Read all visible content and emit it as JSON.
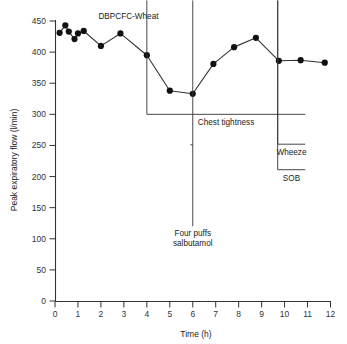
{
  "chart_data": {
    "type": "line",
    "title": "",
    "xlabel": "Time (h)",
    "ylabel": "Peak expiratory flow (l/min)",
    "xlim": [
      0,
      12
    ],
    "ylim": [
      0,
      450
    ],
    "grid": false,
    "legend": "none",
    "x_ticks": [
      "0",
      "1",
      "2",
      "3",
      "4",
      "5",
      "6",
      "7",
      "8",
      "9",
      "10",
      "11",
      "12"
    ],
    "x_tick_values": [
      0,
      1,
      2,
      3,
      4,
      5,
      6,
      7,
      8,
      9,
      10,
      11,
      12
    ],
    "y_ticks": [
      "0",
      "50",
      "100",
      "150",
      "200",
      "250",
      "300",
      "350",
      "400",
      "450"
    ],
    "y_tick_values": [
      0,
      50,
      100,
      150,
      200,
      250,
      300,
      350,
      400,
      450
    ],
    "series": [
      {
        "name": "Peak expiratory flow",
        "marker": "filled-circle",
        "color": "#111111",
        "x": [
          0.2,
          0.45,
          0.6,
          0.85,
          1.0,
          1.25,
          2.0,
          2.85,
          4.0,
          5.0,
          6.0,
          6.9,
          7.8,
          8.75,
          9.75,
          10.7,
          11.75
        ],
        "y": [
          431,
          443,
          433,
          421,
          430,
          434,
          410,
          430,
          395,
          338,
          333,
          381,
          408,
          423,
          386,
          387,
          383
        ]
      }
    ],
    "annotations": [
      {
        "id": "challenge-label",
        "text": "DBPCFC-Wheat",
        "type": "text",
        "x": 3.2,
        "y": 452
      },
      {
        "id": "chest-tightness",
        "text": "Chest tightness",
        "type": "double-arrow",
        "x_start": 4.0,
        "x_end": 10.9,
        "y": 300
      },
      {
        "id": "wheeze",
        "text": "Wheeze",
        "type": "double-arrow",
        "x_start": 9.7,
        "x_end": 10.9,
        "y": 252
      },
      {
        "id": "sob",
        "text": "SOB",
        "type": "double-arrow",
        "x_start": 9.7,
        "x_end": 10.9,
        "y": 211
      },
      {
        "id": "salbutamol",
        "text": "Four puffs salbutamol",
        "text_line_1": "Four puffs",
        "text_line_2": "salbutamol",
        "type": "up-arrow",
        "x": 6.0,
        "y_start": 120,
        "y_end": 251
      }
    ]
  },
  "axes": {
    "x_label": "Time (h)",
    "y_label": "Peak expiratory flow (l/min)"
  },
  "annotations_text": {
    "challenge": "DBPCFC-Wheat",
    "chest_tightness": "Chest tightness",
    "wheeze": "Wheeze",
    "sob": "SOB",
    "salbutamol_line1": "Four puffs",
    "salbutamol_line2": "salbutamol"
  },
  "style": {
    "line_color": "#333333",
    "marker_color": "#111111",
    "text_color": "#222222",
    "background": "#ffffff"
  }
}
